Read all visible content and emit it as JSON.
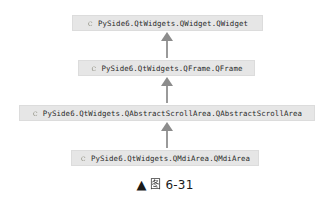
{
  "figure": {
    "type": "class-inheritance-diagram",
    "background_color": "#ffffff",
    "box_fill_color": "#e6e6e6",
    "box_border_color": "#dcdcdc",
    "arrow_color": "#9a9a9a",
    "text_color": "#2b2b2b"
  },
  "diagram": {
    "nodes": [
      {
        "icon": "class-icon",
        "icon_glyph": "C",
        "label": "PySide6.QtWidgets.QWidget.QWidget"
      },
      {
        "icon": "class-icon",
        "icon_glyph": "C",
        "label": "PySide6.QtWidgets.QFrame.QFrame"
      },
      {
        "icon": "class-icon",
        "icon_glyph": "C",
        "label": "PySide6.QtWidgets.QAbstractScrollArea.QAbstractScrollArea"
      },
      {
        "icon": "class-icon",
        "icon_glyph": "C",
        "label": "PySide6.QtWidgets.QMdiArea.QMdiArea"
      }
    ],
    "edges": [
      {
        "from": "PySide6.QtWidgets.QFrame.QFrame",
        "to": "PySide6.QtWidgets.QWidget.QWidget",
        "direction": "up",
        "kind": "inherits"
      },
      {
        "from": "PySide6.QtWidgets.QAbstractScrollArea.QAbstractScrollArea",
        "to": "PySide6.QtWidgets.QFrame.QFrame",
        "direction": "up",
        "kind": "inherits"
      },
      {
        "from": "PySide6.QtWidgets.QMdiArea.QMdiArea",
        "to": "PySide6.QtWidgets.QAbstractScrollArea.QAbstractScrollArea",
        "direction": "up",
        "kind": "inherits"
      }
    ]
  },
  "caption": {
    "marker": "▲",
    "cjk_label": "图",
    "number": "6-31"
  }
}
